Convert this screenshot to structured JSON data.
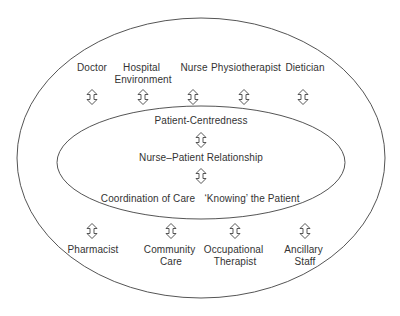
{
  "diagram": {
    "type": "nested-ellipse-relationship-diagram",
    "colors": {
      "line": "#555555",
      "text": "#333333",
      "background": "#ffffff"
    },
    "outer_ring": {
      "top_labels": [
        {
          "lines": [
            "Doctor"
          ]
        },
        {
          "lines": [
            "Hospital",
            "Environment"
          ]
        },
        {
          "lines": [
            "Nurse"
          ]
        },
        {
          "lines": [
            "Physiotherapist"
          ]
        },
        {
          "lines": [
            "Dietician"
          ]
        }
      ],
      "bottom_labels": [
        {
          "lines": [
            "Pharmacist"
          ]
        },
        {
          "lines": [
            "Community",
            "Care"
          ]
        },
        {
          "lines": [
            "Occupational",
            "Therapist"
          ]
        },
        {
          "lines": [
            "Ancillary",
            "Staff"
          ]
        }
      ]
    },
    "inner_ring": {
      "top": "Patient-Centredness",
      "center": "Nurse–Patient Relationship",
      "bottom_left": "Coordination of Care",
      "bottom_right": "‘Knowing’ the Patient"
    },
    "arrow_icon": "double-headed-vertical-arrow"
  }
}
